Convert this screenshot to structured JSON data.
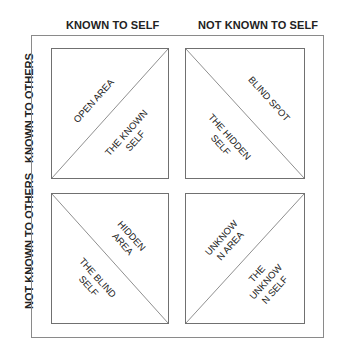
{
  "columns": [
    "KNOWN TO SELF",
    "NOT KNOWN TO SELF"
  ],
  "rows": [
    "KNOWN TO OTHERS",
    "NOT KNOWN TO OTHERS"
  ],
  "quadrants": {
    "top_left": {
      "upper": "OPEN AREA",
      "lower": "THE KNOWN\nSELF",
      "diagonal": "bottom-left to top-right"
    },
    "top_right": {
      "upper": "BLIND SPOT",
      "lower": "THE HIDDEN\nSELF",
      "diagonal": "top-left to bottom-right"
    },
    "bottom_left": {
      "upper": "HIDDEN\nAREA",
      "lower": "THE BLIND\nSELF",
      "diagonal": "top-left to bottom-right"
    },
    "bottom_right": {
      "upper": "UNKNOW\nN AREA",
      "lower": "THE\nUNKNOW\nN SELF",
      "diagonal": "bottom-left to top-right"
    }
  },
  "colors": {
    "line": "#707070",
    "text": "#222222",
    "background": "#ffffff"
  }
}
